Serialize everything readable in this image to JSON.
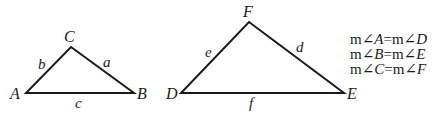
{
  "diagram": {
    "triangle_abc": {
      "vertices": {
        "A": "A",
        "B": "B",
        "C": "C"
      },
      "sides": {
        "a": "a",
        "b": "b",
        "c": "c"
      }
    },
    "triangle_def": {
      "vertices": {
        "D": "D",
        "E": "E",
        "F": "F"
      },
      "sides": {
        "d": "d",
        "e": "e",
        "f": "f"
      }
    },
    "equations": [
      {
        "left_prefix": "m",
        "left_angle": "∠",
        "left_var": "A",
        "equals": "=",
        "right_prefix": "m",
        "right_angle": "∠",
        "right_var": "D"
      },
      {
        "left_prefix": "m",
        "left_angle": "∠",
        "left_var": "B",
        "equals": "=",
        "right_prefix": "m",
        "right_angle": "∠",
        "right_var": "E"
      },
      {
        "left_prefix": "m",
        "left_angle": "∠",
        "left_var": "C",
        "equals": "=",
        "right_prefix": "m",
        "right_angle": "∠",
        "right_var": "F"
      }
    ]
  }
}
